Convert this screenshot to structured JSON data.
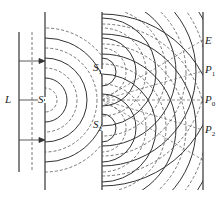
{
  "diagram": {
    "labels": {
      "source": "L",
      "single_slit": "S",
      "slit1": "S",
      "slit1_sub": "1",
      "slit2": "S",
      "slit2_sub": "2",
      "screen": "E",
      "p1": "P",
      "p1_sub": "1",
      "p0": "P",
      "p0_sub": "0",
      "p2": "P",
      "p2_sub": "2"
    },
    "colors": {
      "line": "#333333",
      "dashed": "#555555",
      "background": "#ffffff"
    }
  }
}
